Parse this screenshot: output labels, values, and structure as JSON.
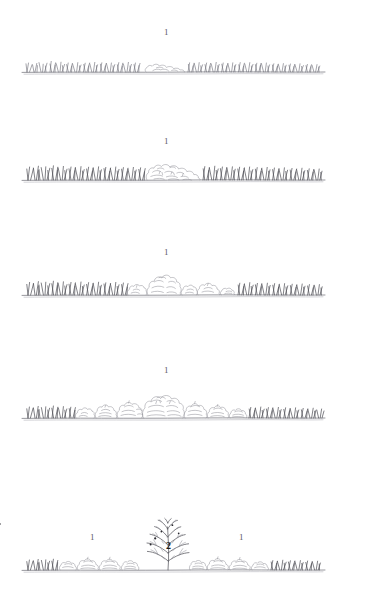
{
  "figure": {
    "type": "vegetation-profile-diagram",
    "medium": "hand-drawn pen-and-ink line drawing",
    "background_color": "#ffffff",
    "ink_color": "#6d6d76",
    "panel_count": 5
  },
  "panels": [
    {
      "id": "panel-1",
      "index": 1,
      "ground_line": {
        "x1": 22,
        "x2": 325,
        "y": 72
      },
      "labels": [
        {
          "text": "1",
          "x": 166,
          "y": 31,
          "bold": false,
          "stratum": "grass-herb-layer"
        }
      ],
      "vegetation": {
        "grass_height_px": 14,
        "shrub_count": 1,
        "shrub_height_px": 9,
        "cover": "grass dominant, single low shrub patch at centre"
      }
    },
    {
      "id": "panel-2",
      "index": 2,
      "ground_line": {
        "x1": 22,
        "x2": 325,
        "y": 180
      },
      "labels": [
        {
          "text": "1",
          "x": 166,
          "y": 140,
          "bold": false,
          "stratum": "grass-herb-layer"
        }
      ],
      "vegetation": {
        "grass_height_px": 17,
        "shrub_count": 3,
        "shrub_height_px": 15,
        "cover": "grass dominant with a broad low shrub cluster at centre"
      }
    },
    {
      "id": "panel-3",
      "index": 3,
      "ground_line": {
        "x1": 22,
        "x2": 325,
        "y": 295
      },
      "labels": [
        {
          "text": "1",
          "x": 166,
          "y": 251,
          "bold": false,
          "stratum": "grass-herb-layer"
        }
      ],
      "vegetation": {
        "grass_height_px": 16,
        "shrub_count": 6,
        "shrub_height_px": 27,
        "cover": "grass flanks with a central group of rounded shrubs, tallest at centre"
      }
    },
    {
      "id": "panel-4",
      "index": 4,
      "ground_line": {
        "x1": 22,
        "x2": 325,
        "y": 418
      },
      "labels": [
        {
          "text": "1",
          "x": 166,
          "y": 369,
          "bold": false,
          "stratum": "grass-herb-layer"
        }
      ],
      "vegetation": {
        "grass_height_px": 13,
        "shrub_count": 9,
        "shrub_height_px": 34,
        "cover": "near-continuous shrub canopy forming a dome, grass only at the margins"
      }
    },
    {
      "id": "panel-5",
      "index": 5,
      "ground_line": {
        "x1": 22,
        "x2": 325,
        "y": 570
      },
      "labels": [
        {
          "text": "1",
          "x": 92,
          "y": 537,
          "bold": false,
          "stratum": "grass-herb-layer"
        },
        {
          "text": "2",
          "x": 168,
          "y": 546,
          "bold": true,
          "stratum": "tree-shrub-layer"
        },
        {
          "text": "1",
          "x": 241,
          "y": 537,
          "bold": false,
          "stratum": "grass-herb-layer"
        }
      ],
      "vegetation": {
        "grass_height_px": 12,
        "shrub_count": 8,
        "shrub_height_px": 20,
        "tree_count": 1,
        "tree_height_px": 48,
        "cover": "low shrub mosaic flanking a single branched emergent tree at centre"
      }
    }
  ],
  "legend": {
    "stratum_1": "1",
    "stratum_2": "2"
  }
}
